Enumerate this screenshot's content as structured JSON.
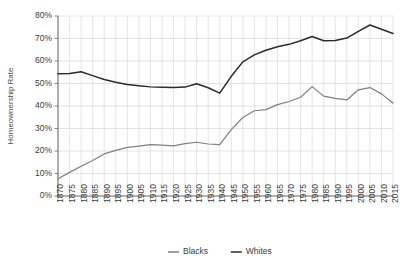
{
  "chart_data": {
    "type": "line",
    "title": "",
    "xlabel": "",
    "ylabel": "Homeownership Rate",
    "ylim": [
      0,
      80
    ],
    "yticks": [
      "0%",
      "10%",
      "20%",
      "30%",
      "40%",
      "50%",
      "60%",
      "70%",
      "80%"
    ],
    "ytick_values": [
      0,
      10,
      20,
      30,
      40,
      50,
      60,
      70,
      80
    ],
    "grid": true,
    "legend_position": "bottom",
    "xlim": [
      1870,
      2015
    ],
    "x": [
      1870,
      1875,
      1880,
      1885,
      1890,
      1895,
      1900,
      1905,
      1910,
      1915,
      1920,
      1925,
      1930,
      1935,
      1940,
      1945,
      1950,
      1955,
      1960,
      1965,
      1970,
      1975,
      1980,
      1985,
      1990,
      1995,
      2000,
      2005,
      2010,
      2015
    ],
    "categories": [
      "1870",
      "1875",
      "1880",
      "1885",
      "1890",
      "1895",
      "1900",
      "1905",
      "1910",
      "1915",
      "1920",
      "1925",
      "1930",
      "1935",
      "1940",
      "1945",
      "1950",
      "1955",
      "1960",
      "1965",
      "1970",
      "1975",
      "1980",
      "1985",
      "1990",
      "1995",
      "2000",
      "2005",
      "2010",
      "2015"
    ],
    "series": [
      {
        "name": "Blacks",
        "color": "#808080",
        "values": [
          7.7,
          10.5,
          13.2,
          15.8,
          18.7,
          20.3,
          21.6,
          22.2,
          22.8,
          22.6,
          22.3,
          23.3,
          23.9,
          23.1,
          22.8,
          29.5,
          34.9,
          37.9,
          38.4,
          40.6,
          42.0,
          43.9,
          48.6,
          44.4,
          43.4,
          42.7,
          47.2,
          48.2,
          45.4,
          41.3
        ]
      },
      {
        "name": "Whites",
        "color": "#2b2b2b",
        "values": [
          54.3,
          54.4,
          55.2,
          53.5,
          51.8,
          50.6,
          49.6,
          49.0,
          48.5,
          48.3,
          48.2,
          48.4,
          49.9,
          48.1,
          45.7,
          53.2,
          59.6,
          62.7,
          64.8,
          66.3,
          67.4,
          69.0,
          70.9,
          69.0,
          69.1,
          70.2,
          73.2,
          76.0,
          74.1,
          72.2
        ]
      }
    ]
  },
  "legend": {
    "items": [
      {
        "label": "Blacks",
        "color": "#808080"
      },
      {
        "label": "Whites",
        "color": "#2b2b2b"
      }
    ]
  },
  "axes": {
    "y_title": "Homeownership Rate"
  }
}
